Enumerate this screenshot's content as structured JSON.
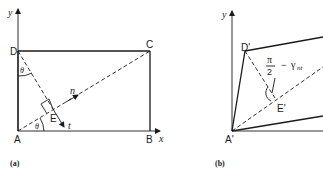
{
  "panel_a": {
    "caption": "(a)",
    "axis_x_label": "x",
    "axis_y_label": "y",
    "points": {
      "A": "A",
      "B": "B",
      "C": "C",
      "D": "D",
      "E": "E"
    },
    "vectors": {
      "n": "n",
      "t": "t"
    },
    "angle_label_top": "θ",
    "angle_label_bottom": "θ"
  },
  "panel_b": {
    "caption": "(b)",
    "axis_y_label": "y",
    "points": {
      "A": "A'",
      "D": "D'",
      "E": "E'"
    },
    "angle_numerator": "π",
    "angle_denominator": "2",
    "angle_minus": "−",
    "angle_gamma": "γ",
    "angle_subscript": "nt"
  }
}
